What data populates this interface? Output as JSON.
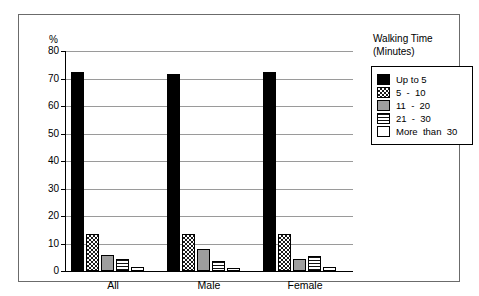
{
  "chart_data": {
    "type": "bar",
    "title": "",
    "xlabel": "",
    "ylabel": "%",
    "ylim": [
      0,
      80
    ],
    "yticks": [
      0,
      10,
      20,
      30,
      40,
      50,
      60,
      70,
      80
    ],
    "ytick_labels": [
      "0",
      "10",
      "20",
      "30",
      "40",
      "50",
      "60",
      "70",
      "80"
    ],
    "grid": true,
    "categories": [
      "All",
      "Male",
      "Female"
    ],
    "legend_title": "Walking Time\n(Minutes)",
    "legend_position": "right",
    "series": [
      {
        "name": "Up to 5",
        "fill": "solid-black",
        "values": [
          72.5,
          71.5,
          72.5
        ]
      },
      {
        "name": "5 - 10",
        "fill": "checker",
        "values": [
          13.5,
          13.5,
          13.5
        ]
      },
      {
        "name": "11 - 20",
        "fill": "gray",
        "values": [
          6.0,
          8.0,
          4.5
        ]
      },
      {
        "name": "21 - 30",
        "fill": "hlines",
        "values": [
          4.5,
          3.5,
          5.5
        ]
      },
      {
        "name": "More than 30",
        "fill": "white",
        "values": [
          1.5,
          1.0,
          1.5
        ]
      }
    ]
  },
  "legend": {
    "title_line1": "Walking Time",
    "title_line2": "(Minutes)",
    "items": [
      {
        "label": "Up to 5",
        "fill": "solid-black"
      },
      {
        "label": "5  -  10",
        "fill": "checker"
      },
      {
        "label": "11  -  20",
        "fill": "gray"
      },
      {
        "label": "21  -  30",
        "fill": "hlines"
      },
      {
        "label": "More  than  30",
        "fill": "white"
      }
    ]
  }
}
